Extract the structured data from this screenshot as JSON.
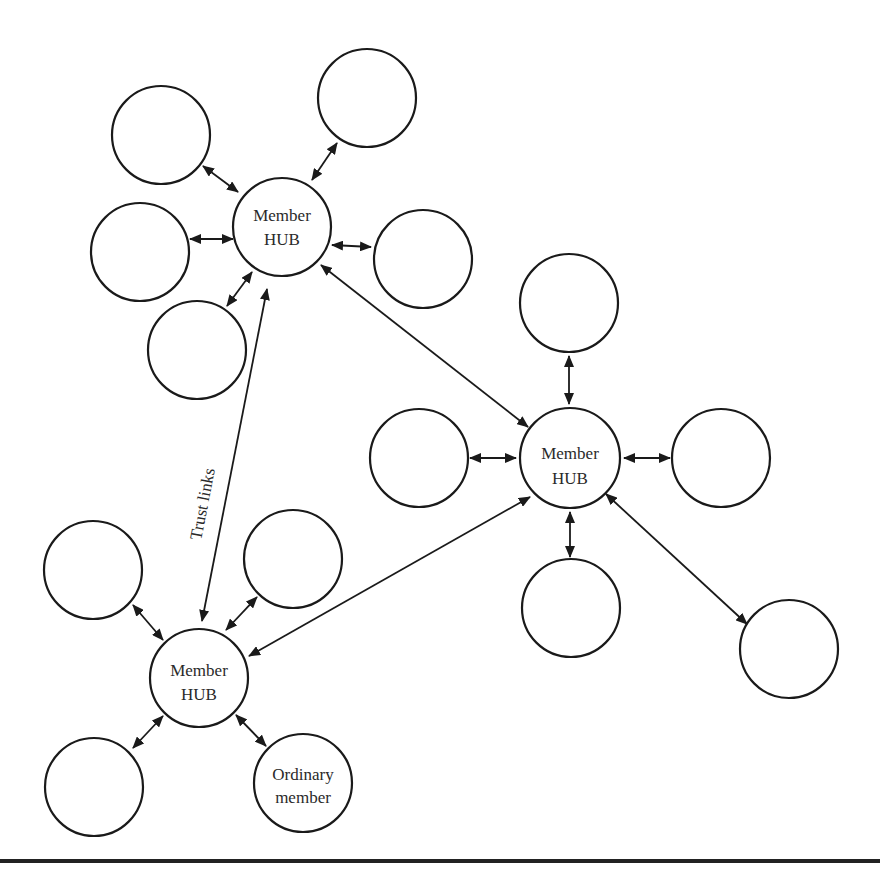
{
  "diagram": {
    "label_color": "#2a2a2a",
    "line_color": "#1a1a1a",
    "hubs": [
      {
        "id": "hub-top",
        "line1": "Member",
        "line2": "HUB",
        "cx": 282,
        "cy": 227,
        "r": 49
      },
      {
        "id": "hub-right",
        "line1": "Member",
        "line2": "HUB",
        "cx": 570,
        "cy": 458,
        "r": 50
      },
      {
        "id": "hub-bottom-left",
        "line1": "Member",
        "line2": "HUB",
        "cx": 199,
        "cy": 678,
        "r": 49
      }
    ],
    "ordinary_member": {
      "line1": "Ordinary",
      "line2": "member",
      "cx": 303,
      "cy": 783,
      "r": 49
    },
    "trust_links_label": "Trust links",
    "member_nodes": [
      {
        "hub": "hub-top",
        "cx": 161,
        "cy": 135
      },
      {
        "hub": "hub-top",
        "cx": 367,
        "cy": 98
      },
      {
        "hub": "hub-top",
        "cx": 140,
        "cy": 252
      },
      {
        "hub": "hub-top",
        "cx": 423,
        "cy": 259
      },
      {
        "hub": "hub-top",
        "cx": 197,
        "cy": 350
      },
      {
        "hub": "hub-right",
        "cx": 569,
        "cy": 303
      },
      {
        "hub": "hub-right",
        "cx": 419,
        "cy": 458
      },
      {
        "hub": "hub-right",
        "cx": 721,
        "cy": 458
      },
      {
        "hub": "hub-right",
        "cx": 571,
        "cy": 608
      },
      {
        "hub": "hub-right",
        "cx": 789,
        "cy": 649
      },
      {
        "hub": "hub-bottom-left",
        "cx": 93,
        "cy": 570
      },
      {
        "hub": "hub-bottom-left",
        "cx": 293,
        "cy": 559
      },
      {
        "hub": "hub-bottom-left",
        "cx": 94,
        "cy": 787
      }
    ]
  }
}
